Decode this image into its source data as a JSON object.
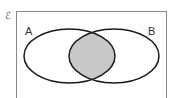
{
  "diagram": {
    "type": "venn",
    "universal_set_symbol": "ℰ",
    "sets": [
      {
        "label": "A"
      },
      {
        "label": "B"
      }
    ],
    "shaded_region": "A ∩ B",
    "colors": {
      "outline": "#1a1a1a",
      "shade": "#c8c8c8",
      "frame": "#888888",
      "background": "#ffffff"
    }
  }
}
